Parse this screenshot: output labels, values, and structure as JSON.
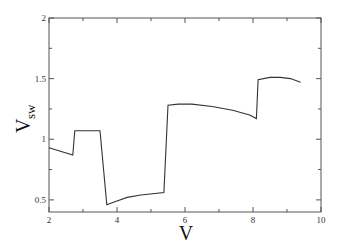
{
  "chart_data": {
    "type": "line",
    "title": "",
    "xlabel": "V",
    "ylabel": "V",
    "ylabel_subscript": "sw",
    "xlim": [
      2,
      10
    ],
    "ylim": [
      0.4,
      2
    ],
    "grid": false,
    "legend": null,
    "x_ticks": [
      2,
      4,
      6,
      8,
      10
    ],
    "x_tick_labels": [
      "2",
      "4",
      "6",
      "8",
      "10"
    ],
    "x_minor_ticks": [
      3,
      5,
      7,
      9
    ],
    "y_ticks": [
      0.5,
      1,
      1.5,
      2
    ],
    "y_tick_labels": [
      "0.5",
      "1",
      "1.5",
      "2"
    ],
    "y_minor_ticks": [
      0.75,
      1.25,
      1.75
    ],
    "series": [
      {
        "name": "V_sw",
        "color": "#333333",
        "points": [
          [
            2.0,
            0.93
          ],
          [
            2.7,
            0.87
          ],
          [
            2.76,
            1.07
          ],
          [
            3.5,
            1.07
          ],
          [
            3.7,
            0.46
          ],
          [
            4.0,
            0.49
          ],
          [
            4.3,
            0.52
          ],
          [
            4.7,
            0.54
          ],
          [
            5.38,
            0.56
          ],
          [
            5.5,
            1.28
          ],
          [
            5.8,
            1.29
          ],
          [
            6.2,
            1.29
          ],
          [
            6.8,
            1.27
          ],
          [
            7.4,
            1.24
          ],
          [
            7.9,
            1.2
          ],
          [
            8.1,
            1.17
          ],
          [
            8.15,
            1.49
          ],
          [
            8.5,
            1.51
          ],
          [
            8.8,
            1.51
          ],
          [
            9.1,
            1.5
          ],
          [
            9.4,
            1.47
          ]
        ]
      }
    ]
  },
  "plot_area": {
    "left": 49,
    "right": 321,
    "top": 18,
    "bottom": 212
  },
  "colors": {
    "axis": "#555555",
    "line": "#333333",
    "background": "#ffffff"
  }
}
